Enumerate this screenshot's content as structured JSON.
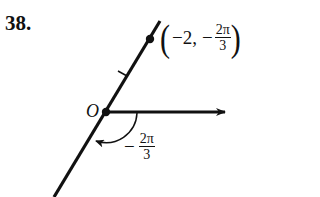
{
  "problem": {
    "number": "38."
  },
  "figure": {
    "origin_label": "O",
    "point": {
      "open_paren": "(",
      "r_text": "−2,",
      "theta_sign": "−",
      "theta_numerator": "2π",
      "theta_denominator": "3",
      "close_paren": ")"
    },
    "angle": {
      "sign": "−",
      "numerator": "2π",
      "denominator": "3"
    },
    "colors": {
      "ink": "#111111",
      "background": "#ffffff"
    }
  }
}
